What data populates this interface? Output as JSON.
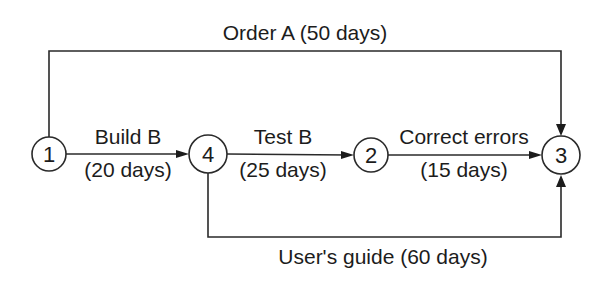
{
  "diagram": {
    "type": "activity-on-arrow network",
    "nodes": [
      {
        "id": "1",
        "label": "1",
        "cx": 49,
        "cy": 154,
        "r": 17
      },
      {
        "id": "4",
        "label": "4",
        "cx": 208,
        "cy": 154,
        "r": 19
      },
      {
        "id": "2",
        "label": "2",
        "cx": 371,
        "cy": 155,
        "r": 17
      },
      {
        "id": "3",
        "label": "3",
        "cx": 561,
        "cy": 155,
        "r": 19
      }
    ],
    "edges": [
      {
        "from": "1",
        "to": "3",
        "activity": "Order A",
        "duration": "(50 days)",
        "label": "Order A (50 days)"
      },
      {
        "from": "1",
        "to": "4",
        "activity": "Build B",
        "duration": "(20 days)"
      },
      {
        "from": "4",
        "to": "2",
        "activity": "Test B",
        "duration": "(25 days)"
      },
      {
        "from": "2",
        "to": "3",
        "activity": "Correct errors",
        "duration": "(15 days)"
      },
      {
        "from": "4",
        "to": "3",
        "activity": "User's guide",
        "duration": "(60 days)",
        "label": "User's guide (60 days)"
      }
    ]
  }
}
